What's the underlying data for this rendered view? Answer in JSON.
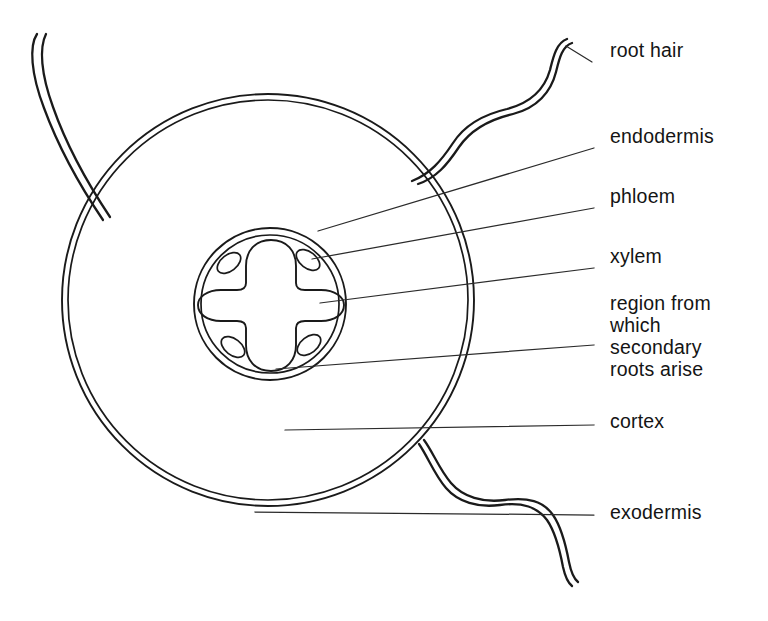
{
  "figure": {
    "background_color": "#ffffff",
    "ink_color": "#1a1a1a",
    "leader_color": "#2b2b2b"
  },
  "labels": [
    {
      "id": "root-hair",
      "text": "root hair",
      "x": 610,
      "y": 57,
      "leader": {
        "x1": 592,
        "y1": 62,
        "x2": 566,
        "y2": 46
      }
    },
    {
      "id": "endodermis",
      "text": "endodermis",
      "x": 610,
      "y": 143,
      "leader": {
        "x1": 594,
        "y1": 148,
        "x2": 318,
        "y2": 231
      }
    },
    {
      "id": "phloem",
      "text": "phloem",
      "x": 610,
      "y": 203,
      "leader": {
        "x1": 594,
        "y1": 208,
        "x2": 312,
        "y2": 259
      }
    },
    {
      "id": "xylem",
      "text": "xylem",
      "x": 610,
      "y": 263,
      "leader": {
        "x1": 594,
        "y1": 268,
        "x2": 320,
        "y2": 303
      }
    },
    {
      "id": "secondary-roots",
      "lines": [
        "region from",
        "which",
        "secondary",
        "roots arise"
      ],
      "x": 610,
      "y": 310,
      "line_height": 22,
      "leader": {
        "x1": 594,
        "y1": 345,
        "x2": 276,
        "y2": 369
      }
    },
    {
      "id": "cortex",
      "text": "cortex",
      "x": 610,
      "y": 428,
      "leader": {
        "x1": 594,
        "y1": 425,
        "x2": 285,
        "y2": 430
      }
    },
    {
      "id": "exodermis",
      "text": "exodermis",
      "x": 610,
      "y": 519,
      "leader": {
        "x1": 594,
        "y1": 515,
        "x2": 255,
        "y2": 512
      }
    }
  ],
  "structures": {
    "cortex_circle": {
      "cx": 268,
      "cy": 300,
      "r_outer": 206,
      "r_inner": 200
    },
    "stele_circle": {
      "cx": 270,
      "cy": 304,
      "r_outer": 76,
      "r_inner": 69
    },
    "xylem": {
      "cx": 271,
      "cy": 304,
      "shape": "four-armed-cross"
    },
    "phloem_patches": [
      {
        "cx": 229,
        "cy": 263,
        "rx": 13,
        "ry": 8,
        "rotate": -38
      },
      {
        "cx": 308,
        "cy": 260,
        "rx": 13,
        "ry": 8,
        "rotate": 38
      },
      {
        "cx": 233,
        "cy": 347,
        "rx": 13,
        "ry": 8,
        "rotate": 38
      },
      {
        "cx": 309,
        "cy": 345,
        "rx": 13,
        "ry": 8,
        "rotate": -38
      }
    ],
    "root_hairs": [
      {
        "id": "root-hair-upper-left",
        "description": "curves up and left from cortex wall"
      },
      {
        "id": "root-hair-upper-right",
        "description": "s-curve up and right from cortex wall"
      },
      {
        "id": "root-hair-lower-right",
        "description": "s-curve down and right from cortex wall"
      }
    ]
  }
}
